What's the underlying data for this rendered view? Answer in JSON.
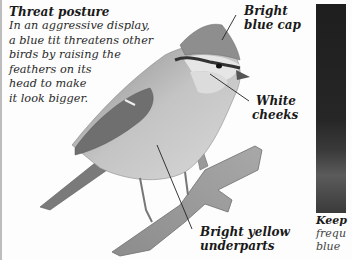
{
  "caption": {
    "title": "Threat posture",
    "lines": [
      "In an aggressive display,",
      "a blue tit threatens other",
      "birds by raising the",
      "feathers on its",
      "head to make",
      "it look bigger."
    ]
  },
  "labels": {
    "cap": [
      "Bright",
      "blue cap"
    ],
    "cheeks": [
      "White",
      "cheeks"
    ],
    "underparts": [
      "Bright yellow",
      "underparts"
    ]
  },
  "photo_caption": {
    "title": "Keep",
    "lines": [
      "frequ",
      "blue"
    ]
  },
  "illustration": {
    "subject": "blue tit perched on branch",
    "colors": {
      "background": "#fdfdfd",
      "text": "#1a1a1a",
      "photo_dark": "#1e1e1e"
    }
  }
}
